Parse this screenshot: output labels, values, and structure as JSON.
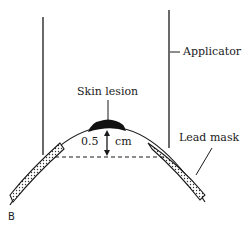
{
  "diagram": {
    "labels": {
      "applicator": "Applicator",
      "skin_lesion": "Skin lesion",
      "distance_value": "0.5",
      "distance_unit": "cm",
      "lead_mask": "Lead mask",
      "panel": "B"
    },
    "colors": {
      "ink": "#1a1a1a",
      "background": "#ffffff"
    }
  }
}
